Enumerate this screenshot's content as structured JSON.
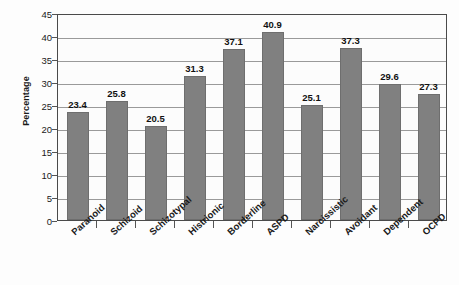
{
  "chart_data": {
    "type": "bar",
    "title": "",
    "subtitle": "",
    "xlabel": "",
    "ylabel": "Percentage",
    "ylim": [
      0,
      45
    ],
    "ytick_step": 5,
    "yticks": [
      45,
      40,
      35,
      30,
      25,
      20,
      15,
      10,
      5,
      0
    ],
    "grid": true,
    "legend": "none",
    "bar_color": "#808080",
    "bar_border_color": "#6e6e6e",
    "gridline_color": "#9a9a9a",
    "axis_color": "#4a4a4a",
    "text_color": "#1a1a1a",
    "show_value_labels": true,
    "categories": [
      "Paranoid",
      "Schizoid",
      "Schizotypal",
      "Histrionic",
      "Borderline",
      "ASPD",
      "Narcissistic",
      "Avoidant",
      "Dependent",
      "OCPD"
    ],
    "values": [
      23.4,
      25.8,
      20.5,
      31.3,
      37.1,
      40.9,
      25.1,
      37.3,
      29.6,
      27.3
    ],
    "value_labels": [
      "23.4",
      "25.8",
      "20.5",
      "31.3",
      "37.1",
      "40.9",
      "25.1",
      "37.3",
      "29.6",
      "27.3"
    ]
  }
}
